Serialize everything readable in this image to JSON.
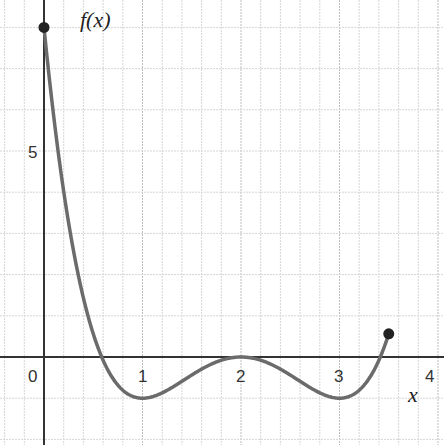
{
  "chart_data": {
    "type": "line",
    "title": "",
    "xlabel": "x",
    "ylabel": "f(x)",
    "function": "f(x) = (x-2)^4 - 2(x-2)^2",
    "domain": [
      0,
      3.5
    ],
    "xlim": [
      -0.45,
      4.05
    ],
    "ylim": [
      -2.1,
      8.7
    ],
    "x_ticks": [
      0,
      1,
      2,
      3,
      4
    ],
    "x_tick_labels": [
      "0",
      "1",
      "2",
      "3",
      "4"
    ],
    "y_ticks": [
      5
    ],
    "y_tick_labels": [
      "5"
    ],
    "grid": true,
    "x_minor_step": 0.2,
    "y_minor_step": 1,
    "endpoints": [
      {
        "x": 0,
        "y": 8,
        "closed": true
      },
      {
        "x": 3.5,
        "y": 0.5625,
        "closed": true
      }
    ],
    "key_points": [
      {
        "x": 0,
        "y": 8
      },
      {
        "x": 0.586,
        "y": 0
      },
      {
        "x": 1,
        "y": -1
      },
      {
        "x": 2,
        "y": 0
      },
      {
        "x": 3,
        "y": -1
      },
      {
        "x": 3.414,
        "y": 0
      },
      {
        "x": 3.5,
        "y": 0.5625
      }
    ],
    "colors": {
      "curve": "#6b6b6b",
      "axis": "#333333",
      "grid": "#d0d0d0",
      "point": "#222222"
    }
  },
  "labels": {
    "y_axis": "f(x)",
    "x_axis": "x",
    "origin": "0",
    "x1": "1",
    "x2": "2",
    "x3": "3",
    "x4": "4",
    "y5": "5"
  }
}
